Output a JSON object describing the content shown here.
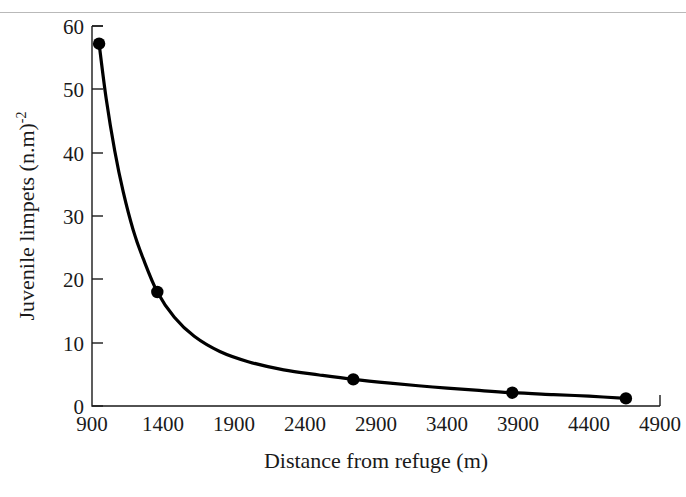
{
  "figure": {
    "background_color": "#ffffff",
    "rule_color": "#b9b9b9",
    "curve_color": "#000000",
    "axis_color": "#1a1a1a"
  },
  "chart_data": {
    "type": "line",
    "title": "",
    "subtitle": "",
    "xlabel": "Distance from refuge (m)",
    "ylabel": "Juvenile limpets (n.m)",
    "ylabel_superscript": "-2",
    "ylabel_full": "Juvenile limpets (n.m)⁻²",
    "xlim": [
      900,
      4900
    ],
    "ylim": [
      0,
      60
    ],
    "xticks": [
      900,
      1400,
      1900,
      2400,
      2900,
      3400,
      3900,
      4400,
      4900
    ],
    "xtick_labels": [
      "900",
      "1400",
      "1900",
      "2400",
      "2900",
      "3400",
      "3900",
      "4400",
      "4900"
    ],
    "yticks": [
      0,
      10,
      20,
      30,
      40,
      50,
      60
    ],
    "ytick_labels": [
      "0",
      "10",
      "20",
      "30",
      "40",
      "50",
      "60"
    ],
    "grid": false,
    "legend": null,
    "series": [
      {
        "name": "Juvenile limpet density",
        "marker": "filled-circle",
        "line": "solid",
        "points": [
          {
            "x": 950,
            "y": 57.2
          },
          {
            "x": 1360,
            "y": 18.0
          },
          {
            "x": 2740,
            "y": 4.2
          },
          {
            "x": 3860,
            "y": 2.1
          },
          {
            "x": 4660,
            "y": 1.2
          }
        ]
      }
    ],
    "fitted_curve": [
      {
        "x": 950,
        "y": 57.2
      },
      {
        "x": 1000,
        "y": 48.5
      },
      {
        "x": 1060,
        "y": 40.3
      },
      {
        "x": 1120,
        "y": 33.8
      },
      {
        "x": 1190,
        "y": 27.8
      },
      {
        "x": 1260,
        "y": 23.3
      },
      {
        "x": 1360,
        "y": 18.0
      },
      {
        "x": 1480,
        "y": 14.0
      },
      {
        "x": 1620,
        "y": 11.0
      },
      {
        "x": 1800,
        "y": 8.6
      },
      {
        "x": 2000,
        "y": 7.0
      },
      {
        "x": 2250,
        "y": 5.7
      },
      {
        "x": 2500,
        "y": 4.9
      },
      {
        "x": 2740,
        "y": 4.2
      },
      {
        "x": 3000,
        "y": 3.6
      },
      {
        "x": 3300,
        "y": 3.0
      },
      {
        "x": 3600,
        "y": 2.5
      },
      {
        "x": 3860,
        "y": 2.1
      },
      {
        "x": 4150,
        "y": 1.8
      },
      {
        "x": 4400,
        "y": 1.55
      },
      {
        "x": 4660,
        "y": 1.2
      }
    ]
  }
}
